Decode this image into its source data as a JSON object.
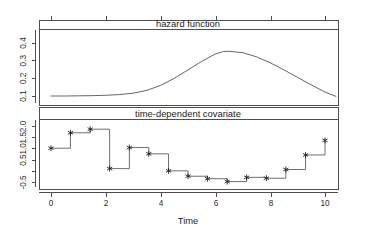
{
  "figure": {
    "background_color": "#ffffff",
    "line_color": "#3c3c3c",
    "marker_color": "#1a1a1a"
  },
  "axis": {
    "x_title": "Time",
    "x_ticks": [
      "0",
      "2",
      "4",
      "6",
      "8",
      "10"
    ],
    "top_y_ticks": [
      "0.1",
      "0.2",
      "0.3",
      "0.4"
    ],
    "bottom_y_ticks": [
      "-0.5",
      "0.0",
      "0.5",
      "1.0",
      "1.5",
      "2.0"
    ]
  },
  "panels": {
    "top_title": "hazard function",
    "bottom_title": "time-dependent covariate"
  },
  "chart_data": [
    {
      "type": "line",
      "title": "hazard function",
      "xlabel": "Time",
      "ylabel": "",
      "xlim": [
        -0.5,
        10.6
      ],
      "ylim": [
        0.0,
        0.46
      ],
      "grid": false,
      "legend": "none",
      "xticks": [
        0,
        2,
        4,
        6,
        8,
        10
      ],
      "yticks": [
        0.1,
        0.2,
        0.3,
        0.4
      ],
      "x": [
        0.0,
        0.5,
        1.0,
        1.5,
        2.0,
        2.5,
        3.0,
        3.5,
        4.0,
        4.5,
        5.0,
        5.5,
        6.0,
        6.3,
        6.5,
        7.0,
        7.5,
        8.0,
        8.5,
        9.0,
        9.5,
        10.0,
        10.4
      ],
      "y": [
        0.1,
        0.1,
        0.101,
        0.102,
        0.104,
        0.108,
        0.116,
        0.132,
        0.16,
        0.2,
        0.248,
        0.296,
        0.338,
        0.352,
        0.353,
        0.345,
        0.322,
        0.288,
        0.248,
        0.205,
        0.163,
        0.122,
        0.098
      ]
    },
    {
      "type": "line",
      "title": "time-dependent covariate",
      "xlabel": "Time",
      "ylabel": "",
      "xlim": [
        -0.5,
        10.6
      ],
      "ylim": [
        -0.78,
        2.3
      ],
      "grid": false,
      "legend": "none",
      "drawstyle": "steps-post",
      "marker": "asterisk",
      "xticks": [
        0,
        2,
        4,
        6,
        8,
        10
      ],
      "yticks": [
        -0.5,
        0.0,
        0.5,
        1.0,
        1.5,
        2.0
      ],
      "x": [
        0.0,
        0.71,
        1.43,
        2.14,
        2.86,
        3.57,
        4.29,
        5.0,
        5.71,
        6.43,
        7.14,
        7.86,
        8.57,
        9.29,
        10.0
      ],
      "y": [
        1.03,
        1.72,
        1.88,
        0.12,
        1.06,
        0.78,
        0.02,
        -0.22,
        -0.33,
        -0.46,
        -0.27,
        -0.31,
        0.08,
        0.73,
        1.38
      ]
    }
  ]
}
